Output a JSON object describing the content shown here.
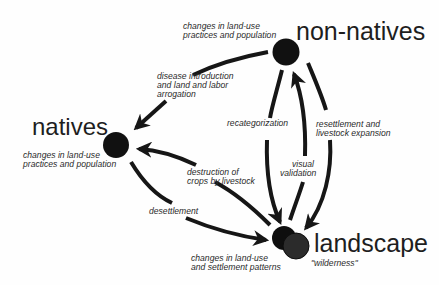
{
  "diagram": {
    "colors": {
      "stroke": "#161616",
      "node": "#111111",
      "text": "#1e1e1e",
      "background": "#fefefe"
    },
    "nodes": {
      "non_natives": {
        "label": "non-natives",
        "annotation": [
          "changes in land-use",
          "practices and population"
        ]
      },
      "natives": {
        "label": "natives",
        "annotation": [
          "changes in land-use",
          "practices and population"
        ]
      },
      "landscape": {
        "label": "landscape",
        "annotation": [
          "changes in land-use",
          "and settlement patterns"
        ],
        "sublabel": "\"wilderness\""
      }
    },
    "edges": [
      {
        "from": "non-natives",
        "to": "natives",
        "label": [
          "disease introduction",
          "and land and labor",
          "arrogation"
        ]
      },
      {
        "from": "non-natives",
        "to": "landscape",
        "label": [
          "recategorization"
        ]
      },
      {
        "from": "landscape",
        "to": "non-natives",
        "label": [
          "visual",
          "validation"
        ]
      },
      {
        "from": "non-natives",
        "to": "landscape",
        "label": [
          "resettlement and",
          "livestock expansion"
        ]
      },
      {
        "from": "landscape",
        "to": "natives",
        "label": [
          "destruction of",
          "crops by livestock"
        ]
      },
      {
        "from": "natives",
        "to": "landscape",
        "label": [
          "desettlement"
        ]
      }
    ]
  }
}
